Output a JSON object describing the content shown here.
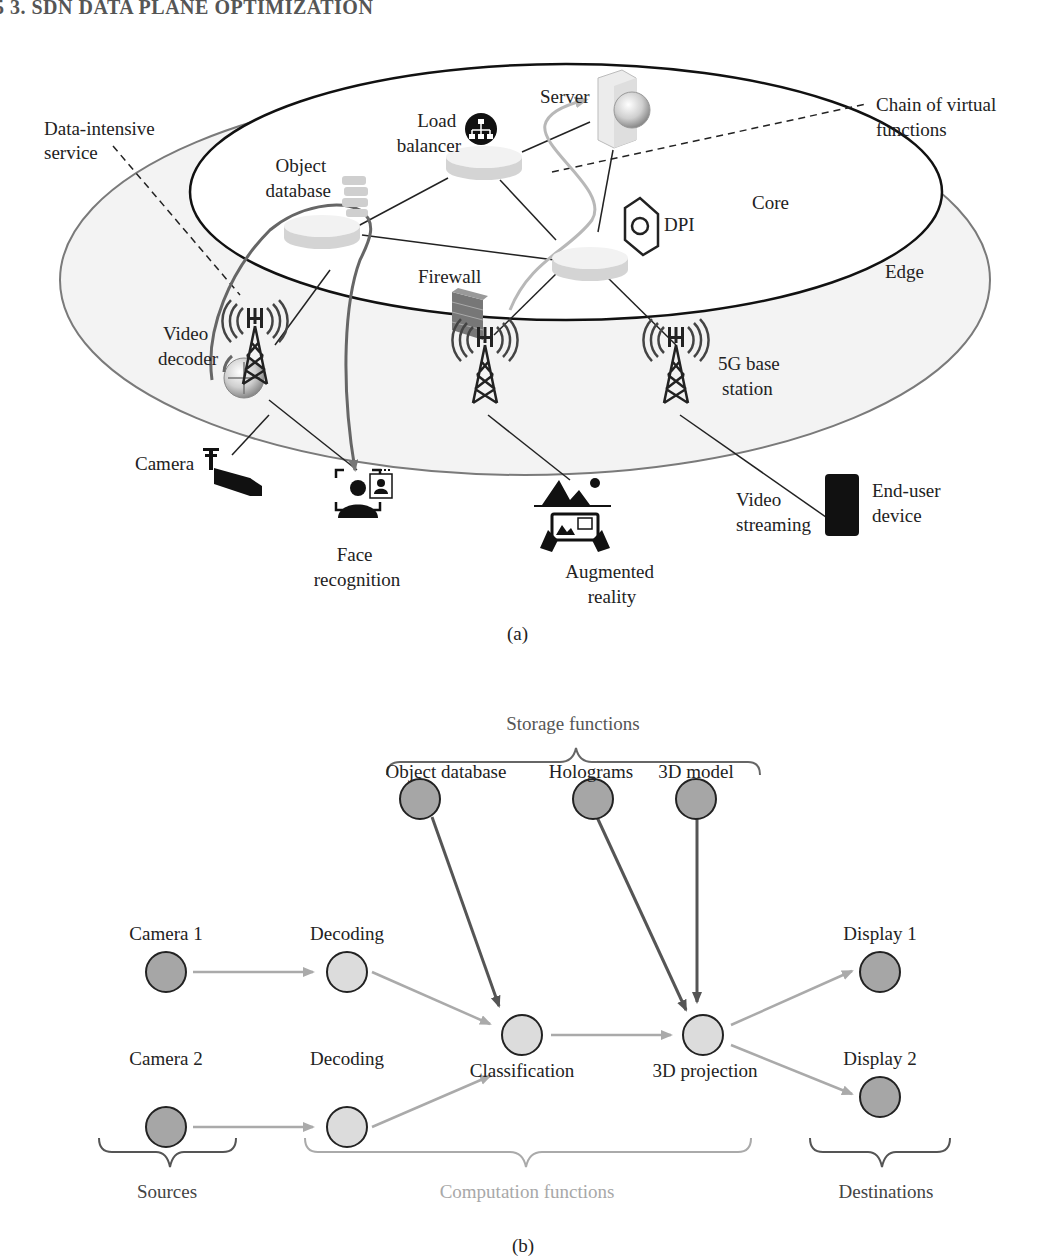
{
  "header": {
    "running_head": "5   3. SDN DATA PLANE OPTIMIZATION"
  },
  "figure_a": {
    "caption": "(a)",
    "regions": {
      "core": "Core",
      "edge": "Edge"
    },
    "callouts": {
      "data_intensive": [
        "Data-intensive",
        "service"
      ],
      "chain": [
        "Chain of virtual",
        "functions"
      ]
    },
    "components": {
      "server": "Server",
      "load_balancer": [
        "Load",
        "balancer"
      ],
      "object_database": [
        "Object",
        "database"
      ],
      "dpi": "DPI",
      "firewall": "Firewall",
      "video_decoder": [
        "Video",
        "decoder"
      ],
      "base_station": [
        "5G base",
        "station"
      ],
      "camera": "Camera",
      "face_recognition": [
        "Face",
        "recognition"
      ],
      "augmented_reality": [
        "Augmented",
        "reality"
      ],
      "video_streaming": [
        "Video",
        "streaming"
      ],
      "end_user_device": [
        "End-user",
        "device"
      ]
    }
  },
  "figure_b": {
    "caption": "(b)",
    "groups": {
      "storage": "Storage functions",
      "sources": "Sources",
      "computation": "Computation functions",
      "destinations": "Destinations"
    },
    "nodes": {
      "object_database": "Object database",
      "holograms": "Holograms",
      "model_3d": "3D model",
      "camera1": "Camera 1",
      "camera2": "Camera 2",
      "decoding1": "Decoding",
      "decoding2": "Decoding",
      "classification": "Classification",
      "projection": "3D projection",
      "display1": "Display 1",
      "display2": "Display 2"
    },
    "colors": {
      "source_dest_node": "#a6a6a6",
      "compute_node": "#dcdcdc",
      "storage_node": "#a6a6a6",
      "light_arrow": "#aaaaaa",
      "dark_arrow": "#555555"
    }
  }
}
